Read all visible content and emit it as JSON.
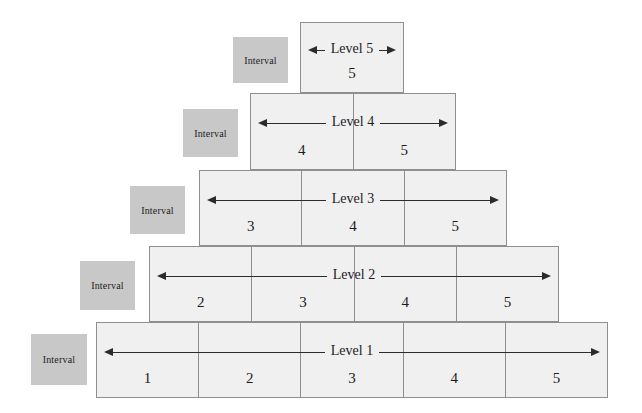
{
  "figure": {
    "name": "interval-pyramid-diagram",
    "colors": {
      "cell_fill": "#f0f0f0",
      "cell_border": "#8e8e8e",
      "interval_fill": "#c8c8c8",
      "arrow": "#2b2b2b",
      "text": "#1c1c1c",
      "background": "#ffffff"
    },
    "interval_label": "Interval",
    "levels": [
      {
        "id": "level-5",
        "label": "Level 5",
        "cells": [
          "5"
        ],
        "left": 300,
        "top": 22,
        "width": 104,
        "height": 71,
        "interval_left": 233,
        "interval_top": 37,
        "interval_width": 55,
        "interval_height": 46
      },
      {
        "id": "level-4",
        "label": "Level 4",
        "cells": [
          "4",
          "5"
        ],
        "left": 250,
        "top": 93,
        "width": 206,
        "height": 77,
        "interval_left": 183,
        "interval_top": 109,
        "interval_width": 55,
        "interval_height": 48
      },
      {
        "id": "level-3",
        "label": "Level 3",
        "cells": [
          "3",
          "4",
          "5"
        ],
        "left": 199,
        "top": 170,
        "width": 308,
        "height": 76,
        "interval_left": 130,
        "interval_top": 186,
        "interval_width": 55,
        "interval_height": 48
      },
      {
        "id": "level-2",
        "label": "Level 2",
        "cells": [
          "2",
          "3",
          "4",
          "5"
        ],
        "left": 149,
        "top": 246,
        "width": 410,
        "height": 76,
        "interval_left": 80,
        "interval_top": 261,
        "interval_width": 55,
        "interval_height": 49
      },
      {
        "id": "level-1",
        "label": "Level 1",
        "cells": [
          "1",
          "2",
          "3",
          "4",
          "5"
        ],
        "left": 96,
        "top": 322,
        "width": 512,
        "height": 76,
        "interval_left": 31,
        "interval_top": 334,
        "interval_width": 56,
        "interval_height": 51
      }
    ]
  }
}
